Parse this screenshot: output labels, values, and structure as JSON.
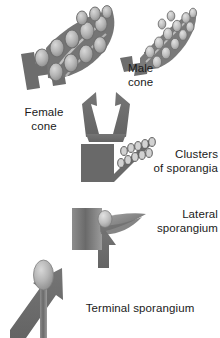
{
  "figure": {
    "type": "botanical-evolution-diagram",
    "background_color": "#ffffff",
    "ink_color": "#6e6e6e",
    "text_color": "#1a1a1a"
  },
  "labels": {
    "male_cone": "Male\ncone",
    "female_cone": "Female\ncone",
    "clusters_of_sporangia": "Clusters\nof sporangia",
    "lateral_sporangium": "Lateral\nsporangium",
    "terminal_sporangium": "Terminal sporangium"
  },
  "stages": [
    {
      "order": 1,
      "name": "terminal-sporangium",
      "label": "Terminal sporangium",
      "description": "Single upright stalk bearing one oval sporangium at its tip"
    },
    {
      "order": 2,
      "name": "lateral-sporangium",
      "label": "Lateral sporangium",
      "description": "Shaded stem block with a leaf-like blade bearing a sporangium on its side"
    },
    {
      "order": 3,
      "name": "clusters-of-sporangia",
      "label": "Clusters of sporangia",
      "description": "Dark stem block with a branched axis carrying two rows of small sporangia"
    },
    {
      "order": 4,
      "name": "female-cone",
      "label": "Female cone",
      "description": "Broad cone with large oval ovules arranged in rows along scale-like blades"
    },
    {
      "order": 5,
      "name": "male-cone",
      "label": "Male cone",
      "description": "Narrow elongated cone with small oval pollen sporangia along the axis"
    }
  ],
  "arrows": [
    {
      "name": "arrow-terminal-to-lateral",
      "from": "terminal-sporangium",
      "to": "lateral-sporangium",
      "direction": "up-right"
    },
    {
      "name": "arrow-lateral-to-clusters",
      "from": "lateral-sporangium",
      "to": "clusters-of-sporangia",
      "direction": "up"
    },
    {
      "name": "arrow-clusters-to-cones",
      "from": "clusters-of-sporangia",
      "to": "female-cone and male-cone",
      "direction": "forked-up"
    }
  ],
  "counts": {
    "female_cone_ovules": 12,
    "male_cone_sporangia": 16,
    "cluster_sporangia_rows": 2,
    "cluster_sporangia_per_row": 5
  }
}
